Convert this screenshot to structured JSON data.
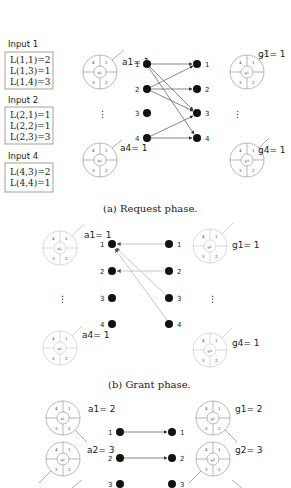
{
  "figure": {
    "phases": [
      {
        "id": "request",
        "caption": "(a) Request phase.",
        "inputs": [
          {
            "title": "Input 1",
            "rows": [
              "L(1,1)=2",
              "L(1,3)=1",
              "L(1,4)=3"
            ]
          },
          {
            "title": "Input 2",
            "rows": [
              "L(2,1)=1",
              "L(2,2)=1",
              "L(2,3)=3"
            ]
          },
          {
            "title": "Input 4",
            "rows": [
              "L(4,3)=2",
              "L(4,4)=1"
            ]
          }
        ],
        "arbiters": [
          {
            "name": "a1",
            "label": "a1= 1",
            "pointer": 1
          },
          {
            "name": "a4",
            "label": "a4= 1",
            "pointer": 1
          }
        ],
        "grant_arbiters": [
          {
            "name": "g1",
            "label": "g1= 1",
            "pointer": 1
          },
          {
            "name": "g4",
            "label": "g4= 1",
            "pointer": 1
          }
        ],
        "left_nodes": [
          "1",
          "2",
          "3",
          "4"
        ],
        "right_nodes": [
          "1",
          "2",
          "3",
          "4"
        ],
        "edges": [
          {
            "from": 1,
            "to": 1
          },
          {
            "from": 1,
            "to": 3
          },
          {
            "from": 1,
            "to": 4
          },
          {
            "from": 2,
            "to": 1
          },
          {
            "from": 2,
            "to": 2
          },
          {
            "from": 2,
            "to": 3
          },
          {
            "from": 4,
            "to": 3
          },
          {
            "from": 4,
            "to": 4
          }
        ],
        "ellipsis": "⋮"
      },
      {
        "id": "grant",
        "caption": "(b) Grant phase.",
        "arbiters": [
          {
            "name": "a1",
            "label": "a1= 1",
            "pointer": 1
          },
          {
            "name": "a4",
            "label": "a4= 1",
            "pointer": 1
          }
        ],
        "grant_arbiters": [
          {
            "name": "g1",
            "label": "g1= 1",
            "pointer": 1
          },
          {
            "name": "g4",
            "label": "g4= 1",
            "pointer": 1
          }
        ],
        "left_nodes": [
          "1",
          "2",
          "3",
          "4"
        ],
        "right_nodes": [
          "1",
          "2",
          "3",
          "4"
        ],
        "edges": [
          {
            "from": 1,
            "to": 1
          },
          {
            "from": 2,
            "to": 2
          },
          {
            "from": 3,
            "to": 1
          },
          {
            "from": 4,
            "to": 1
          }
        ],
        "ellipsis": "⋮"
      },
      {
        "id": "accept",
        "caption": "",
        "arbiters": [
          {
            "name": "a1",
            "label": "a1= 2",
            "pointer": 2
          },
          {
            "name": "a2",
            "label": "a2= 3",
            "pointer": 3
          }
        ],
        "grant_arbiters": [
          {
            "name": "g1",
            "label": "g1= 2",
            "pointer": 2
          },
          {
            "name": "g2",
            "label": "g2= 3",
            "pointer": 3
          }
        ],
        "left_nodes": [
          "1",
          "2",
          "3"
        ],
        "right_nodes": [
          "1",
          "2",
          "3"
        ],
        "edges": [
          {
            "from": 1,
            "to": 1
          },
          {
            "from": 2,
            "to": 2
          }
        ]
      }
    ],
    "rr_slots": [
      "1",
      "2",
      "3",
      "4"
    ]
  }
}
